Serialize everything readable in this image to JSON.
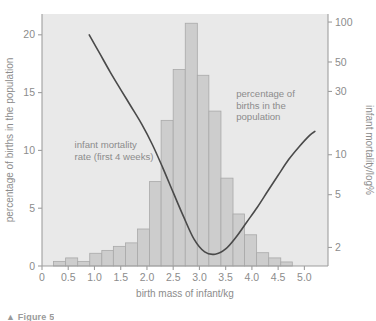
{
  "figure": {
    "caption": "▲ Figure 5",
    "background_color": "#ffffff",
    "plot_background_color": "#e9e9e9",
    "bar_fill_color": "#cdcdcd",
    "bar_border_color": "#a9a9a9",
    "curve_color": "#4a4a4a",
    "text_color": "#8c8c8c",
    "axis_color": "#9e9e9e"
  },
  "chart_data": {
    "type": "bar",
    "title": "",
    "subtitle": "",
    "xlabel": "birth mass of infant/kg",
    "ylabel": "percentage of births in the population",
    "y2label": "infant mortality/log%",
    "xlim": [
      0,
      5.45
    ],
    "ylim": [
      0,
      21.8
    ],
    "y2lim_log": [
      1.45,
      115
    ],
    "grid": false,
    "legend": "none",
    "xticks": [
      "0",
      "0.5",
      "1.0",
      "1.5",
      "2.0",
      "2.5",
      "3.0",
      "3.5",
      "4.0",
      "4.5",
      "5.0"
    ],
    "xtick_values": [
      0,
      0.5,
      1.0,
      1.5,
      2.0,
      2.5,
      3.0,
      3.5,
      4.0,
      4.5,
      5.0
    ],
    "yticks": [
      "0",
      "5",
      "10",
      "15",
      "20"
    ],
    "ytick_values": [
      0,
      5,
      10,
      15,
      20
    ],
    "y2ticks": [
      "2",
      "5",
      "10",
      "30",
      "50",
      "100"
    ],
    "y2tick_values": [
      2,
      5,
      10,
      30,
      50,
      100
    ],
    "bar_series_name": "percentage of births in the population",
    "bar_bin_width": 0.227,
    "bars": [
      {
        "x0": 0.22,
        "x1": 0.45,
        "value": 0.4
      },
      {
        "x0": 0.45,
        "x1": 0.68,
        "value": 0.7
      },
      {
        "x0": 0.68,
        "x1": 0.91,
        "value": 0.4
      },
      {
        "x0": 0.91,
        "x1": 1.14,
        "value": 1.1
      },
      {
        "x0": 1.14,
        "x1": 1.36,
        "value": 1.35
      },
      {
        "x0": 1.36,
        "x1": 1.59,
        "value": 1.7
      },
      {
        "x0": 1.59,
        "x1": 1.82,
        "value": 2.0
      },
      {
        "x0": 1.82,
        "x1": 2.05,
        "value": 3.2
      },
      {
        "x0": 2.05,
        "x1": 2.27,
        "value": 7.3
      },
      {
        "x0": 2.27,
        "x1": 2.5,
        "value": 12.6
      },
      {
        "x0": 2.5,
        "x1": 2.73,
        "value": 17.0
      },
      {
        "x0": 2.73,
        "x1": 2.96,
        "value": 21.0
      },
      {
        "x0": 2.96,
        "x1": 3.18,
        "value": 16.5
      },
      {
        "x0": 3.18,
        "x1": 3.41,
        "value": 13.4
      },
      {
        "x0": 3.41,
        "x1": 3.64,
        "value": 7.6
      },
      {
        "x0": 3.64,
        "x1": 3.86,
        "value": 4.5
      },
      {
        "x0": 3.86,
        "x1": 4.09,
        "value": 2.7
      },
      {
        "x0": 4.09,
        "x1": 4.32,
        "value": 1.15
      },
      {
        "x0": 4.32,
        "x1": 4.55,
        "value": 0.7
      },
      {
        "x0": 4.55,
        "x1": 4.77,
        "value": 0.35
      }
    ],
    "curve_series_name": "infant mortality rate (first 4 weeks)",
    "curve_axis": "right-log",
    "curve_points": [
      {
        "x": 0.9,
        "y2": 80
      },
      {
        "x": 1.1,
        "y2": 58
      },
      {
        "x": 1.3,
        "y2": 42
      },
      {
        "x": 1.5,
        "y2": 31
      },
      {
        "x": 1.7,
        "y2": 23
      },
      {
        "x": 1.9,
        "y2": 17
      },
      {
        "x": 2.1,
        "y2": 12
      },
      {
        "x": 2.3,
        "y2": 8.0
      },
      {
        "x": 2.5,
        "y2": 5.2
      },
      {
        "x": 2.7,
        "y2": 3.4
      },
      {
        "x": 2.9,
        "y2": 2.3
      },
      {
        "x": 3.1,
        "y2": 1.85
      },
      {
        "x": 3.3,
        "y2": 1.78
      },
      {
        "x": 3.5,
        "y2": 1.95
      },
      {
        "x": 3.7,
        "y2": 2.4
      },
      {
        "x": 3.9,
        "y2": 3.1
      },
      {
        "x": 4.1,
        "y2": 4.0
      },
      {
        "x": 4.3,
        "y2": 5.3
      },
      {
        "x": 4.5,
        "y2": 7.0
      },
      {
        "x": 4.7,
        "y2": 9.2
      },
      {
        "x": 4.9,
        "y2": 11.5
      },
      {
        "x": 5.1,
        "y2": 14.0
      },
      {
        "x": 5.2,
        "y2": 15.0
      }
    ]
  },
  "annotations": [
    {
      "name": "mortality-annotation",
      "lines": [
        "infant mortality",
        "rate (first 4 weeks)"
      ],
      "x": 0.62,
      "y": 10.2
    },
    {
      "name": "births-annotation",
      "lines": [
        "percentage of",
        "births in the",
        "population"
      ],
      "x": 3.7,
      "y": 14.6
    }
  ]
}
